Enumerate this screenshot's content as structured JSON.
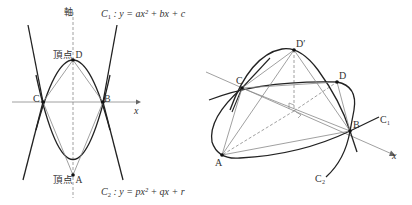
{
  "left_figure": {
    "axis_label": "軸",
    "x_label": "x",
    "vertex_top_label": "頂点 D",
    "vertex_bottom_label": "頂点 A",
    "point_labels": {
      "C": "C",
      "B": "B"
    },
    "curve1": {
      "name": "C",
      "sub": "1",
      "equation": " : y = ax² + bx + c"
    },
    "curve2": {
      "name": "C",
      "sub": "2",
      "equation": " : y = px² + qx + r"
    }
  },
  "right_figure": {
    "point_labels": {
      "D_prime": "D′",
      "D": "D",
      "C": "C",
      "B": "B",
      "A": "A"
    },
    "x_label": "x",
    "curve1_label": "C₁",
    "curve2_label": "C₂"
  },
  "colors": {
    "curve": "#222222",
    "line": "#888888",
    "point": "#111111"
  }
}
